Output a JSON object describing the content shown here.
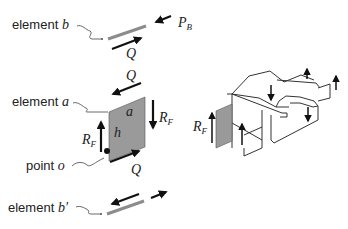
{
  "figure": {
    "left_panel": {
      "element_b": {
        "label_prefix": "element",
        "label_var": "b"
      },
      "force_PB": {
        "symbol": "P",
        "subscript": "B"
      },
      "shear_Q_top_b": {
        "symbol": "Q"
      },
      "element_a": {
        "label_prefix": "element",
        "label_var": "a"
      },
      "shear_Q_top_a": {
        "symbol": "Q"
      },
      "shear_Q_bottom_a": {
        "symbol": "Q"
      },
      "force_RF_right": {
        "symbol": "R",
        "subscript": "F"
      },
      "force_RF_left": {
        "symbol": "R",
        "subscript": "F"
      },
      "dim_a": {
        "symbol": "a"
      },
      "dim_h": {
        "symbol": "h"
      },
      "point_o": {
        "label_prefix": "point",
        "label_var": "o"
      },
      "element_b_prime": {
        "label_prefix": "element",
        "label_var": "b′"
      }
    },
    "right_panel": {
      "force_RF": {
        "symbol": "R",
        "subscript": "F"
      }
    },
    "colors": {
      "panel_fill": "#9a9a9a",
      "element_bar": "#8c8c8c",
      "ink": "#111111"
    }
  }
}
